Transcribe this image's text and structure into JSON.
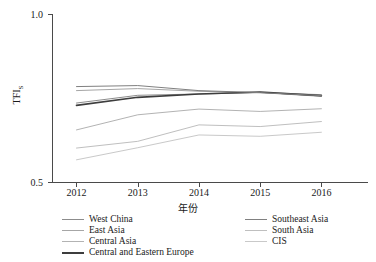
{
  "chart_data": {
    "type": "line",
    "title": "",
    "xlabel": "年份",
    "ylabel": "TFIs",
    "ylabel_main": "TFI",
    "ylabel_sub": "S",
    "x": [
      2012,
      2013,
      2014,
      2015,
      2016
    ],
    "categories": [
      "2012",
      "2013",
      "2014",
      "2015",
      "2016"
    ],
    "xticklabels": [
      "2012",
      "2013",
      "2014",
      "2015",
      "2016"
    ],
    "yticklabels": [
      "0.5",
      "1.0"
    ],
    "ylim": [
      0.5,
      1.0
    ],
    "xlim": [
      2011.6,
      2016.5
    ],
    "grid": false,
    "legend_position": "below-plot, two columns",
    "series": [
      {
        "name": "West China",
        "color": "#8c8c8c",
        "width": 1.0,
        "values": [
          0.735,
          0.758,
          0.762,
          0.766,
          0.755
        ]
      },
      {
        "name": "East Asia",
        "color": "#a6a6a6",
        "width": 1.0,
        "values": [
          0.772,
          0.778,
          0.77,
          0.766,
          0.76
        ]
      },
      {
        "name": "Central Asia",
        "color": "#b3b3b3",
        "width": 1.0,
        "values": [
          0.655,
          0.7,
          0.717,
          0.71,
          0.718
        ]
      },
      {
        "name": "Central and Eastern Europe",
        "color": "#3d3d3d",
        "width": 1.6,
        "values": [
          0.728,
          0.752,
          0.762,
          0.768,
          0.757
        ]
      },
      {
        "name": "Southeast Asia",
        "color": "#808080",
        "width": 1.0,
        "values": [
          0.784,
          0.787,
          0.772,
          0.766,
          0.757
        ]
      },
      {
        "name": "South Asia",
        "color": "#bfbfbf",
        "width": 1.0,
        "values": [
          0.601,
          0.621,
          0.67,
          0.665,
          0.68
        ]
      },
      {
        "name": "CIS",
        "color": "#c9c9c9",
        "width": 1.0,
        "values": [
          0.566,
          0.602,
          0.64,
          0.636,
          0.648
        ]
      }
    ],
    "legend_columns": [
      [
        "West China",
        "East Asia",
        "Central Asia",
        "Central and Eastern Europe"
      ],
      [
        "Southeast Asia",
        "South Asia",
        "CIS"
      ]
    ]
  },
  "legend": {
    "left": [
      {
        "label": "West China",
        "color": "#8c8c8c",
        "thick": false
      },
      {
        "label": "East Asia",
        "color": "#a6a6a6",
        "thick": false
      },
      {
        "label": "Central Asia",
        "color": "#b3b3b3",
        "thick": false
      },
      {
        "label": "Central and Eastern Europe",
        "color": "#3d3d3d",
        "thick": true
      }
    ],
    "right": [
      {
        "label": "Southeast Asia",
        "color": "#808080",
        "thick": false
      },
      {
        "label": "South Asia",
        "color": "#bfbfbf",
        "thick": false
      },
      {
        "label": "CIS",
        "color": "#c9c9c9",
        "thick": false
      }
    ]
  }
}
